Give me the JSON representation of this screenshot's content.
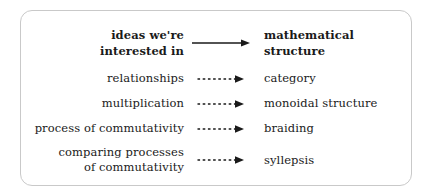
{
  "figure": {
    "frame": {
      "border_color": "#c9c9c9",
      "background": "#ffffff",
      "corner_radius": "12px"
    },
    "text_color": "#1a1a1a",
    "arrow_color": "#1a1a1a"
  },
  "header": {
    "left_line1": "ideas we're",
    "left_line2": "interested in",
    "right_line1": "mathematical",
    "right_line2": "structure",
    "arrow_style": "solid-arrow-icon"
  },
  "rows": [
    {
      "idea_line1": "relationships",
      "idea_line2": "",
      "arrow_style": "dashed-arrow-icon",
      "structure": "category"
    },
    {
      "idea_line1": "multiplication",
      "idea_line2": "",
      "arrow_style": "dashed-arrow-icon",
      "structure": "monoidal structure"
    },
    {
      "idea_line1": "process of commutativity",
      "idea_line2": "",
      "arrow_style": "dashed-arrow-icon",
      "structure": "braiding"
    },
    {
      "idea_line1": "comparing processes",
      "idea_line2": "of commutativity",
      "arrow_style": "dashed-arrow-icon",
      "structure": "syllepsis"
    }
  ]
}
